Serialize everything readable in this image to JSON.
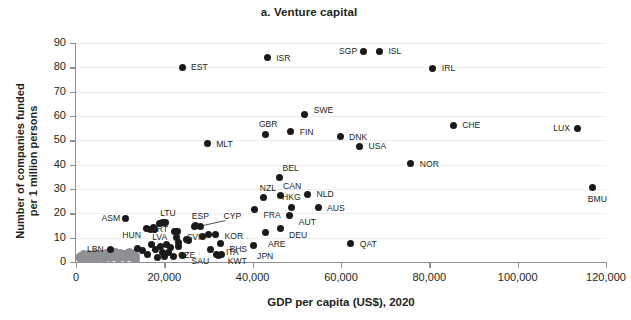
{
  "chart_data": {
    "type": "scatter",
    "title": "a. Venture capital",
    "xlabel": "GDP per capita (US$), 2020",
    "ylabel": "Number of companies funded\nper 1 million persons",
    "xlim": [
      0,
      120000
    ],
    "ylim": [
      0,
      90
    ],
    "xticks": [
      0,
      20000,
      40000,
      60000,
      80000,
      100000,
      120000
    ],
    "xtick_labels": [
      "0",
      "20,000",
      "40,000",
      "60,000",
      "80,000",
      "100,000",
      "120,000"
    ],
    "yticks": [
      0,
      10,
      20,
      30,
      40,
      50,
      60,
      70,
      80,
      90
    ],
    "ytick_labels": [
      "0",
      "10",
      "20",
      "30",
      "40",
      "50",
      "60",
      "70",
      "80",
      "90"
    ],
    "grid": "horizontal",
    "legend": "none",
    "series": [
      {
        "name": "Labelled economies",
        "color": "#1a1a1a",
        "points": [
          {
            "label": "EST",
            "x": 24000,
            "y": 80.0,
            "lx": 9,
            "ly": -4
          },
          {
            "label": "ISR",
            "x": 43300,
            "y": 84.0,
            "lx": 9,
            "ly": -4
          },
          {
            "label": "SGP",
            "x": 65000,
            "y": 86.6,
            "lx": -24,
            "ly": -4
          },
          {
            "label": "ISL",
            "x": 68700,
            "y": 86.6,
            "lx": 9,
            "ly": -4
          },
          {
            "label": "IRL",
            "x": 80800,
            "y": 79.6,
            "lx": 9,
            "ly": -4
          },
          {
            "label": "SWE",
            "x": 51800,
            "y": 60.6,
            "lx": 9,
            "ly": -9
          },
          {
            "label": "CHE",
            "x": 85400,
            "y": 56.3,
            "lx": 9,
            "ly": -4
          },
          {
            "label": "LUX",
            "x": 113500,
            "y": 54.9,
            "lx": -24,
            "ly": -4
          },
          {
            "label": "FIN",
            "x": 48600,
            "y": 53.5,
            "lx": 9,
            "ly": -4
          },
          {
            "label": "GBR",
            "x": 43000,
            "y": 52.6,
            "lx": -7,
            "ly": -14
          },
          {
            "label": "DNK",
            "x": 59800,
            "y": 51.4,
            "lx": 9,
            "ly": -4
          },
          {
            "label": "MLT",
            "x": 29700,
            "y": 48.5,
            "lx": 9,
            "ly": -4
          },
          {
            "label": "USA",
            "x": 64200,
            "y": 47.6,
            "lx": 9,
            "ly": -4
          },
          {
            "label": "NOR",
            "x": 75800,
            "y": 40.3,
            "lx": 9,
            "ly": -4
          },
          {
            "label": "BEL",
            "x": 46100,
            "y": 34.7,
            "lx": 3,
            "ly": -14
          },
          {
            "label": "BMU",
            "x": 117000,
            "y": 30.8,
            "lx": -5,
            "ly": 8
          },
          {
            "label": "CAN",
            "x": 46200,
            "y": 27.2,
            "lx": 3,
            "ly": -14
          },
          {
            "label": "NLD",
            "x": 52400,
            "y": 27.9,
            "lx": 9,
            "ly": -4
          },
          {
            "label": "NZL",
            "x": 42500,
            "y": 26.5,
            "lx": -4,
            "ly": -14
          },
          {
            "label": "AUS",
            "x": 54800,
            "y": 22.3,
            "lx": 9,
            "ly": -4
          },
          {
            "label": "HKG",
            "x": 48700,
            "y": 22.5,
            "lx": -9,
            "ly": -14
          },
          {
            "label": "FRA",
            "x": 40400,
            "y": 21.6,
            "lx": 9,
            "ly": 2
          },
          {
            "label": "AUT",
            "x": 48400,
            "y": 19.1,
            "lx": 9,
            "ly": 2
          },
          {
            "label": "ASM",
            "x": 11200,
            "y": 18.0,
            "lx": -24,
            "ly": -4
          },
          {
            "label": "LTU",
            "x": 20200,
            "y": 16.2,
            "lx": -5,
            "ly": -14
          },
          {
            "label": "ESP",
            "x": 27100,
            "y": 14.8,
            "lx": -4,
            "ly": -14
          },
          {
            "label": "HUN",
            "x": 15900,
            "y": 13.7,
            "lx": -24,
            "ly": 2
          },
          {
            "label": "LVA",
            "x": 17700,
            "y": 13.2,
            "lx": -2,
            "ly": 3
          },
          {
            "label": "PRT",
            "x": 22200,
            "y": 12.6,
            "lx": -23,
            "ly": -6
          },
          {
            "label": "DEU",
            "x": 46200,
            "y": 13.6,
            "lx": 9,
            "ly": 2
          },
          {
            "label": "KOR",
            "x": 31600,
            "y": 11.3,
            "lx": 9,
            "ly": -3
          },
          {
            "label": "CYP",
            "x": 28200,
            "y": 14.7,
            "lx": 23,
            "ly": -14
          },
          {
            "label": "SVN",
            "x": 25500,
            "y": 8.9,
            "lx": -2,
            "ly": -7
          },
          {
            "label": "ARE",
            "x": 43000,
            "y": 12.0,
            "lx": 2,
            "ly": 7
          },
          {
            "label": "QAT",
            "x": 62200,
            "y": 7.7,
            "lx": 9,
            "ly": -3
          },
          {
            "label": "BHS",
            "x": 32700,
            "y": 7.4,
            "lx": 9,
            "ly": 1
          },
          {
            "label": "CZE",
            "x": 23100,
            "y": 6.5,
            "lx": 0,
            "ly": 5
          },
          {
            "label": "JPN",
            "x": 40100,
            "y": 6.6,
            "lx": 4,
            "ly": 6
          },
          {
            "label": "ITA",
            "x": 31900,
            "y": 3.1,
            "lx": 9,
            "ly": -6
          },
          {
            "label": "KWT",
            "x": 32300,
            "y": 2.6,
            "lx": 9,
            "ly": 1
          },
          {
            "label": "SAU",
            "x": 24100,
            "y": 2.6,
            "lx": 9,
            "ly": 1
          },
          {
            "label": "LBN",
            "x": 7900,
            "y": 5.2,
            "lx": -24,
            "ly": -4
          }
        ],
        "unlabelled_points": [
          {
            "x": 14000,
            "y": 5.4
          },
          {
            "x": 15000,
            "y": 4.9
          },
          {
            "x": 16300,
            "y": 3.0
          },
          {
            "x": 17200,
            "y": 7.0
          },
          {
            "x": 17900,
            "y": 5.2
          },
          {
            "x": 18400,
            "y": 2.0
          },
          {
            "x": 19100,
            "y": 6.5
          },
          {
            "x": 19600,
            "y": 4.0
          },
          {
            "x": 20000,
            "y": 2.4
          },
          {
            "x": 20600,
            "y": 7.0
          },
          {
            "x": 21000,
            "y": 3.8
          },
          {
            "x": 18800,
            "y": 15.9
          },
          {
            "x": 19500,
            "y": 16.1
          },
          {
            "x": 17500,
            "y": 14.0
          },
          {
            "x": 16800,
            "y": 13.2
          },
          {
            "x": 22800,
            "y": 9.9
          },
          {
            "x": 23000,
            "y": 12.6
          },
          {
            "x": 23200,
            "y": 8.0
          },
          {
            "x": 25000,
            "y": 9.1
          },
          {
            "x": 26800,
            "y": 14.6
          },
          {
            "x": 28600,
            "y": 10.6
          },
          {
            "x": 30100,
            "y": 11.1
          },
          {
            "x": 30500,
            "y": 5.3
          },
          {
            "x": 33000,
            "y": 3.0
          },
          {
            "x": 21500,
            "y": 6.0
          },
          {
            "x": 22100,
            "y": 2.2
          }
        ]
      },
      {
        "name": "Other economies",
        "color": "#8e9094",
        "points": [],
        "unlabelled_points": [
          {
            "x": 900,
            "y": 1.5
          },
          {
            "x": 1400,
            "y": 1.8
          },
          {
            "x": 1900,
            "y": 1.3
          },
          {
            "x": 2300,
            "y": 2.1
          },
          {
            "x": 2700,
            "y": 1.6
          },
          {
            "x": 3100,
            "y": 2.4
          },
          {
            "x": 3400,
            "y": 1.4
          },
          {
            "x": 3800,
            "y": 2.0
          },
          {
            "x": 4200,
            "y": 2.7
          },
          {
            "x": 4500,
            "y": 1.5
          },
          {
            "x": 4900,
            "y": 2.2
          },
          {
            "x": 5200,
            "y": 1.8
          },
          {
            "x": 5600,
            "y": 2.9
          },
          {
            "x": 5900,
            "y": 1.6
          },
          {
            "x": 6300,
            "y": 2.4
          },
          {
            "x": 6700,
            "y": 1.9
          },
          {
            "x": 7100,
            "y": 3.0
          },
          {
            "x": 7500,
            "y": 1.7
          },
          {
            "x": 8200,
            "y": 2.5
          },
          {
            "x": 8600,
            "y": 2.0
          },
          {
            "x": 9000,
            "y": 3.2
          },
          {
            "x": 9400,
            "y": 1.6
          },
          {
            "x": 9800,
            "y": 2.3
          },
          {
            "x": 10200,
            "y": 2.8
          },
          {
            "x": 10600,
            "y": 1.9
          },
          {
            "x": 11000,
            "y": 3.4
          },
          {
            "x": 11400,
            "y": 2.2
          },
          {
            "x": 11800,
            "y": 1.7
          },
          {
            "x": 12200,
            "y": 2.9
          },
          {
            "x": 12600,
            "y": 2.1
          },
          {
            "x": 13000,
            "y": 3.3
          },
          {
            "x": 13400,
            "y": 1.8
          },
          {
            "x": 13800,
            "y": 2.6
          },
          {
            "x": 1100,
            "y": 2.6
          },
          {
            "x": 1700,
            "y": 2.9
          },
          {
            "x": 2100,
            "y": 3.1
          },
          {
            "x": 2900,
            "y": 3.3
          },
          {
            "x": 3600,
            "y": 3.0
          },
          {
            "x": 4700,
            "y": 3.4
          },
          {
            "x": 5400,
            "y": 3.6
          },
          {
            "x": 6100,
            "y": 3.5
          },
          {
            "x": 6900,
            "y": 3.7
          },
          {
            "x": 7700,
            "y": 3.4
          },
          {
            "x": 8400,
            "y": 3.8
          },
          {
            "x": 9200,
            "y": 3.6
          },
          {
            "x": 10000,
            "y": 3.9
          },
          {
            "x": 10800,
            "y": 3.5
          },
          {
            "x": 11600,
            "y": 4.0
          },
          {
            "x": 12400,
            "y": 3.7
          },
          {
            "x": 13200,
            "y": 4.1
          },
          {
            "x": 1300,
            "y": 1.1
          },
          {
            "x": 2500,
            "y": 1.2
          },
          {
            "x": 3900,
            "y": 1.1
          },
          {
            "x": 5100,
            "y": 1.3
          },
          {
            "x": 6500,
            "y": 1.2
          },
          {
            "x": 7900,
            "y": 1.4
          },
          {
            "x": 9600,
            "y": 1.2
          },
          {
            "x": 11200,
            "y": 1.3
          },
          {
            "x": 12800,
            "y": 1.5
          },
          {
            "x": 13600,
            "y": 1.2
          },
          {
            "x": 700,
            "y": 2.2
          },
          {
            "x": 1600,
            "y": 3.5
          },
          {
            "x": 4400,
            "y": 4.0
          },
          {
            "x": 8900,
            "y": 4.2
          },
          {
            "x": 12000,
            "y": 4.4
          },
          {
            "x": 13100,
            "y": 2.4
          }
        ]
      }
    ]
  }
}
